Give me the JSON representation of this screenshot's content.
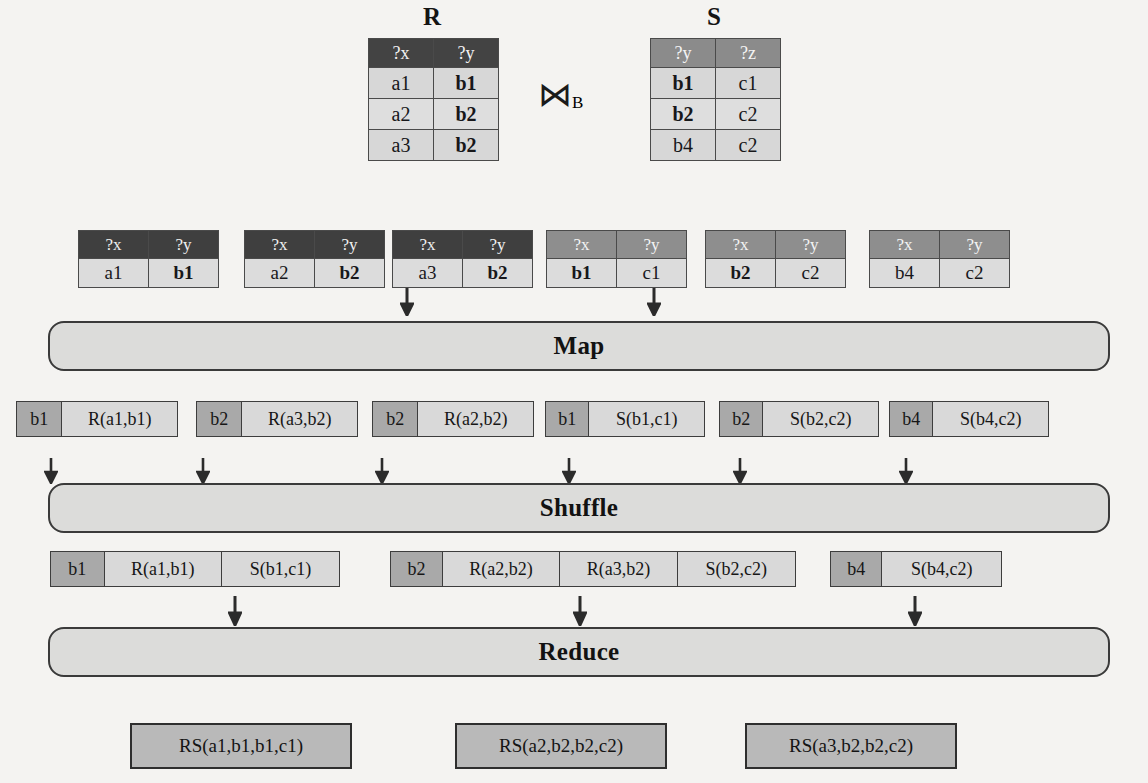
{
  "diagram": {
    "join_symbol": "⋈",
    "join_subscript": "B"
  },
  "relations": {
    "r": {
      "caption": "R",
      "headers": [
        "?x",
        "?y"
      ],
      "rows": [
        [
          "a1",
          "b1"
        ],
        [
          "a2",
          "b2"
        ],
        [
          "a3",
          "b2"
        ]
      ]
    },
    "s": {
      "caption": "S",
      "headers": [
        "?y",
        "?z"
      ],
      "rows": [
        [
          "b1",
          "c1"
        ],
        [
          "b2",
          "c2"
        ],
        [
          "b4",
          "c2"
        ]
      ]
    }
  },
  "split_tables": [
    {
      "headers": [
        "?x",
        "?y"
      ],
      "row": [
        "a1",
        "b1"
      ],
      "style": "dark",
      "bold_col": 1
    },
    {
      "headers": [
        "?x",
        "?y"
      ],
      "row": [
        "a2",
        "b2"
      ],
      "style": "dark",
      "bold_col": 1
    },
    {
      "headers": [
        "?x",
        "?y"
      ],
      "row": [
        "a3",
        "b2"
      ],
      "style": "dark",
      "bold_col": 1
    },
    {
      "headers": [
        "?x",
        "?y"
      ],
      "row": [
        "b1",
        "c1"
      ],
      "style": "mid",
      "bold_col": 0
    },
    {
      "headers": [
        "?x",
        "?y"
      ],
      "row": [
        "b2",
        "c2"
      ],
      "style": "mid",
      "bold_col": 0
    },
    {
      "headers": [
        "?x",
        "?y"
      ],
      "row": [
        "b4",
        "c2"
      ],
      "style": "mid",
      "bold_col": -1
    }
  ],
  "stages": {
    "map": "Map",
    "shuffle": "Shuffle",
    "reduce": "Reduce"
  },
  "map_output": [
    {
      "key": "b1",
      "values": [
        "R(a1,b1)"
      ]
    },
    {
      "key": "b2",
      "values": [
        "R(a3,b2)"
      ]
    },
    {
      "key": "b2",
      "values": [
        "R(a2,b2)"
      ]
    },
    {
      "key": "b1",
      "values": [
        "S(b1,c1)"
      ]
    },
    {
      "key": "b2",
      "values": [
        "S(b2,c2)"
      ]
    },
    {
      "key": "b4",
      "values": [
        "S(b4,c2)"
      ]
    }
  ],
  "shuffle_output": [
    {
      "key": "b1",
      "values": [
        "R(a1,b1)",
        "S(b1,c1)"
      ]
    },
    {
      "key": "b2",
      "values": [
        "R(a2,b2)",
        "R(a3,b2)",
        "S(b2,c2)"
      ]
    },
    {
      "key": "b4",
      "values": [
        "S(b4,c2)"
      ]
    }
  ],
  "reduce_output": [
    "RS(a1,b1,b1,c1)",
    "RS(a2,b2,b2,c2)",
    "RS(a3,b2,b2,c2)"
  ],
  "colors": {
    "page_background": "#f4f3f1",
    "header_dark": "#434343",
    "header_mid": "#8b8b8b",
    "cell_light": "#d7d7d7",
    "key_cell": "#a9a9a9",
    "value_cell": "#d9d9d9",
    "stage_bar": "#dcdcda",
    "result_box": "#b9b9b9",
    "stroke": "#3a3a3a"
  }
}
